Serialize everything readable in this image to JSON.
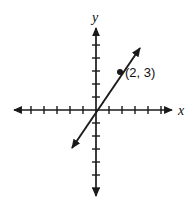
{
  "figure": {
    "background_color": "#ffffff",
    "stroke_color": "#1a1a1a",
    "width": 192,
    "height": 204
  },
  "axes": {
    "x": {
      "label": "x",
      "origin_px": 96,
      "start_px": 14,
      "end_px": 172,
      "y_px": 110,
      "tick_spacing_px": 13,
      "ticks_negative": 6,
      "ticks_positive": 6,
      "tick_half_len_px": 4,
      "label_x_px": 178,
      "label_y_px": 115,
      "arrow_start": true,
      "arrow_end": true
    },
    "y": {
      "label": "y",
      "origin_px": 110,
      "start_px": 28,
      "end_px": 196,
      "x_px": 96,
      "tick_spacing_px": 13,
      "ticks_negative": 6,
      "ticks_positive": 6,
      "tick_half_len_px": 4,
      "label_x_px": 92,
      "label_y_px": 22,
      "arrow_start": true,
      "arrow_end": true
    }
  },
  "chart_data": {
    "type": "line",
    "title": "",
    "xlabel": "x",
    "ylabel": "y",
    "grid": false,
    "legend": false,
    "xlim": [
      -6,
      6
    ],
    "ylim": [
      -6,
      6
    ],
    "series": [
      {
        "name": "line through origin",
        "kind": "line",
        "slope": 1.5,
        "intercept": 0,
        "equation": "y = 1.5x",
        "double_arrow": true,
        "x": [
          -1.85,
          3.4
        ],
        "y": [
          -2.77,
          5.1
        ],
        "pixel_start": [
          72,
          148
        ],
        "pixel_end": [
          140,
          48
        ]
      }
    ],
    "points": [
      {
        "label": "(2, 3)",
        "x": 2,
        "y": 3,
        "pixel_x": 120,
        "pixel_y": 72,
        "marker": "filled-circle",
        "radius_px": 3,
        "label_offset_x_px": 5,
        "label_offset_y_px": 5
      }
    ]
  },
  "annotations": {
    "point_label": "(2, 3)"
  }
}
